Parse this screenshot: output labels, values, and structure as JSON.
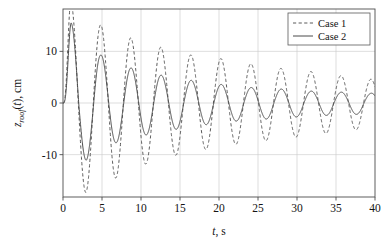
{
  "chart_data": {
    "type": "line",
    "title": "",
    "xlabel": "t, s",
    "ylabel": "z_roof(t), cm",
    "ylabel_base": "z",
    "ylabel_sub": "roof",
    "ylabel_var": "t",
    "ylabel_units": "cm",
    "xlabel_var": "t",
    "xlabel_units": "s",
    "xlim": [
      0,
      40
    ],
    "ylim": [
      -18.2,
      18.2
    ],
    "xticks": [
      0,
      5,
      10,
      15,
      20,
      25,
      30,
      35,
      40
    ],
    "xticklabels": [
      "0",
      "5",
      "10",
      "15",
      "20",
      "25",
      "30",
      "35",
      "40"
    ],
    "yticks": [
      -10,
      0,
      10
    ],
    "yticklabels": [
      "-10",
      "0",
      "10"
    ],
    "grid": true,
    "grid_color": "#c8c8c8",
    "axis_color": "#4d4d4d",
    "background": "#ffffff",
    "legend_position": "top-right",
    "period_s": 3.85,
    "series": [
      {
        "name": "Case 1",
        "style": "dashed",
        "color": "#5a5a5a",
        "dash": "3.2,2.4",
        "width": 1.0,
        "model": "damped_sine",
        "amplitude0": 19.6,
        "decay_rate": 0.0315,
        "period": 3.85,
        "phase_deg": 0,
        "offset": 0,
        "peaks_t": [
          1.0,
          4.85,
          8.7,
          12.55,
          16.4,
          20.25,
          24.1,
          27.95,
          31.8,
          35.65,
          39.5
        ],
        "peaks_y": [
          19.6,
          15.1,
          12.6,
          10.8,
          9.3,
          8.6,
          7.6,
          6.7,
          6.1,
          5.3,
          4.6
        ],
        "troughs_t": [
          2.95,
          6.8,
          10.65,
          14.5,
          18.35,
          22.2,
          26.05,
          29.9,
          33.75,
          37.6
        ],
        "troughs_y": [
          -17.3,
          -14.5,
          -11.8,
          -10.1,
          -9.0,
          -8.0,
          -7.3,
          -6.6,
          -5.9,
          -5.2
        ]
      },
      {
        "name": "Case 2",
        "style": "solid",
        "color": "#4a4a4a",
        "dash": "",
        "width": 1.0,
        "model": "damped_sine_floor",
        "amplitude0": 16.0,
        "decay_rate": 0.105,
        "floor_amplitude": 2.0,
        "period": 3.85,
        "phase_deg": 0,
        "offset": 0,
        "peaks_t": [
          1.05,
          4.85,
          8.7,
          12.55,
          16.4,
          20.25,
          24.1,
          27.95,
          31.8,
          35.65,
          39.5
        ],
        "peaks_y": [
          15.5,
          9.3,
          6.8,
          5.4,
          4.4,
          3.6,
          3.0,
          2.7,
          2.3,
          2.1,
          1.9
        ],
        "troughs_t": [
          2.95,
          6.8,
          10.65,
          14.5,
          18.35,
          22.2,
          26.05,
          29.9,
          33.75,
          37.6
        ],
        "troughs_y": [
          -11.1,
          -7.7,
          -6.2,
          -5.1,
          -4.2,
          -3.5,
          -3.1,
          -2.7,
          -2.4,
          -2.2
        ]
      }
    ]
  },
  "legend": {
    "items": [
      {
        "label": "Case 1",
        "style": "dashed"
      },
      {
        "label": "Case 2",
        "style": "solid"
      }
    ]
  }
}
